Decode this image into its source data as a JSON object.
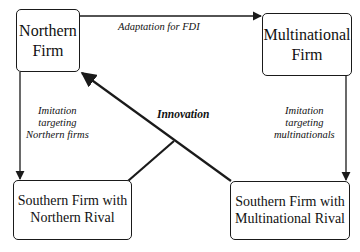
{
  "nodes": {
    "northern_firm": {
      "lines": [
        "Northern",
        "Firm"
      ]
    },
    "multinational_firm": {
      "lines": [
        "Multinational",
        "Firm"
      ]
    },
    "southern_northern": {
      "lines": [
        "Southern Firm with",
        "Northern Rival"
      ]
    },
    "southern_multinational": {
      "lines": [
        "Southern Firm with",
        "Multinational Rival"
      ]
    }
  },
  "edges": {
    "adaptation": {
      "label": "Adaptation for FDI"
    },
    "imitation_northern": {
      "lines": [
        "Imitation",
        "targeting",
        "Northern firms"
      ]
    },
    "imitation_multinational": {
      "lines": [
        "Imitation",
        "targeting",
        "multinationals"
      ]
    },
    "innovation": {
      "label": "Innovation"
    }
  },
  "colors": {
    "line": "#1a1a1a",
    "background": "#ffffff"
  }
}
